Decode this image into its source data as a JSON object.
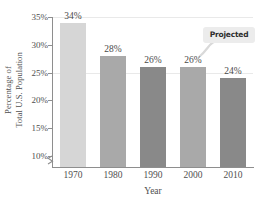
{
  "chart_data": {
    "type": "bar",
    "title": "",
    "xlabel": "Year",
    "ylabel_lines": [
      "Percentage of",
      "Total U.S. Population"
    ],
    "categories": [
      "1970",
      "1980",
      "1990",
      "2000",
      "2010"
    ],
    "values": [
      34,
      28,
      26,
      26,
      24
    ],
    "value_labels": [
      "34%",
      "28%",
      "26%",
      "26%",
      "24%"
    ],
    "ylim": [
      8,
      35
    ],
    "yticks": [
      10,
      15,
      20,
      25,
      30,
      35
    ],
    "ytick_labels": [
      "10%",
      "15%",
      "20%",
      "25%",
      "30%",
      "35%"
    ],
    "grid": true,
    "gridlines_at": [
      25,
      35
    ],
    "axis_break": true,
    "legend": "none",
    "bar_colors": [
      "#d6d6d6",
      "#a9a9a9",
      "#898989",
      "#a9a9a9",
      "#898989"
    ],
    "annotations": [
      {
        "text": "Projected",
        "target_category": "2010",
        "style": "rounded-callout"
      }
    ]
  },
  "axis_colors": {
    "spine": "#8e8e8e",
    "grid": "#e9e9e9",
    "text": "#4f4f4f"
  },
  "annotation_box": {
    "fill": "#ececec",
    "text_color": "#2e2e2e"
  }
}
